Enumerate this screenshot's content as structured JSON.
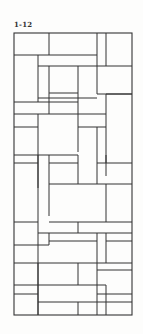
{
  "figure": {
    "label": "1-12",
    "stroke_color": "#333333",
    "background": "#fdfdfc",
    "frame": {
      "x": 14,
      "y": 33,
      "width": 118,
      "height": 282
    },
    "segments": [
      [
        14,
        55,
        97,
        55
      ],
      [
        49,
        33,
        49,
        55
      ],
      [
        97,
        33,
        97,
        66
      ],
      [
        106,
        33,
        106,
        66
      ],
      [
        38,
        55,
        38,
        102
      ],
      [
        38,
        66,
        132,
        66
      ],
      [
        49,
        66,
        49,
        98
      ],
      [
        78,
        66,
        78,
        114
      ],
      [
        97,
        66,
        97,
        94
      ],
      [
        49,
        93,
        78,
        93
      ],
      [
        38,
        98,
        97,
        98
      ],
      [
        97,
        94,
        132,
        94
      ],
      [
        106,
        94,
        132,
        94
      ],
      [
        106,
        94,
        106,
        176
      ],
      [
        14,
        102,
        78,
        102
      ],
      [
        49,
        98,
        49,
        114
      ],
      [
        14,
        114,
        106,
        114
      ],
      [
        38,
        114,
        38,
        188
      ],
      [
        78,
        114,
        78,
        152
      ],
      [
        14,
        127,
        38,
        127
      ],
      [
        78,
        127,
        106,
        127
      ],
      [
        97,
        127,
        97,
        184
      ],
      [
        14,
        155,
        78,
        155
      ],
      [
        38,
        155,
        38,
        330
      ],
      [
        49,
        155,
        49,
        216
      ],
      [
        14,
        163,
        38,
        163
      ],
      [
        49,
        163,
        78,
        163
      ],
      [
        78,
        155,
        78,
        184
      ],
      [
        97,
        163,
        132,
        163
      ],
      [
        106,
        155,
        106,
        163
      ],
      [
        49,
        184,
        132,
        184
      ],
      [
        106,
        184,
        106,
        222
      ],
      [
        14,
        222,
        38,
        222
      ],
      [
        49,
        222,
        132,
        222
      ],
      [
        78,
        222,
        78,
        233
      ],
      [
        38,
        233,
        132,
        233
      ],
      [
        49,
        233,
        49,
        245
      ],
      [
        97,
        233,
        97,
        315
      ],
      [
        106,
        233,
        106,
        263
      ],
      [
        14,
        245,
        49,
        245
      ],
      [
        49,
        241,
        97,
        241
      ],
      [
        106,
        241,
        132,
        241
      ],
      [
        14,
        263,
        132,
        263
      ],
      [
        78,
        263,
        78,
        285
      ],
      [
        38,
        263,
        38,
        315
      ],
      [
        14,
        285,
        106,
        285
      ],
      [
        97,
        270,
        132,
        270
      ],
      [
        14,
        294,
        38,
        294
      ],
      [
        97,
        294,
        132,
        294
      ],
      [
        38,
        302,
        97,
        302
      ],
      [
        78,
        302,
        78,
        315
      ],
      [
        106,
        285,
        106,
        315
      ],
      [
        97,
        302,
        132,
        302
      ]
    ]
  }
}
